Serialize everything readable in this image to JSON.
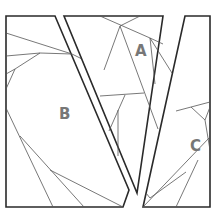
{
  "diagram": {
    "type": "dissection-puzzle",
    "pieces": [
      {
        "id": "A",
        "label": "A"
      },
      {
        "id": "B",
        "label": "B"
      },
      {
        "id": "C",
        "label": "C"
      }
    ],
    "colors": {
      "outline": "#2a2a2a",
      "inner_lines": "#555555",
      "label": "#777777",
      "background": "#ffffff"
    }
  }
}
